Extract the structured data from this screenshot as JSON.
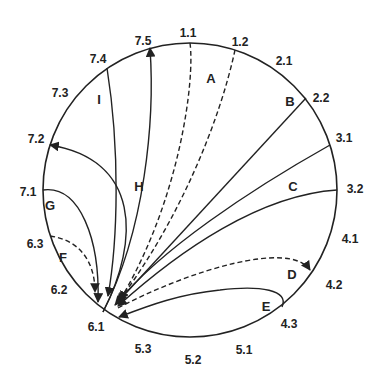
{
  "diagram": {
    "colors": {
      "stroke": "#222222",
      "background": "#ffffff",
      "text": "#222222"
    },
    "circle": {
      "cx": 190,
      "cy": 190,
      "r": 147
    },
    "boundary_labels": [
      {
        "id": "1.1",
        "text": "1.1",
        "x": 188,
        "y": 34
      },
      {
        "id": "1.2",
        "text": "1.2",
        "x": 240,
        "y": 43
      },
      {
        "id": "2.1",
        "text": "2.1",
        "x": 284,
        "y": 62
      },
      {
        "id": "2.2",
        "text": "2.2",
        "x": 321,
        "y": 99
      },
      {
        "id": "3.1",
        "text": "3.1",
        "x": 344,
        "y": 139
      },
      {
        "id": "3.2",
        "text": "3.2",
        "x": 355,
        "y": 190
      },
      {
        "id": "4.1",
        "text": "4.1",
        "x": 350,
        "y": 240
      },
      {
        "id": "4.2",
        "text": "4.2",
        "x": 334,
        "y": 286
      },
      {
        "id": "4.3",
        "text": "4.3",
        "x": 289,
        "y": 325
      },
      {
        "id": "5.1",
        "text": "5.1",
        "x": 244,
        "y": 351
      },
      {
        "id": "5.2",
        "text": "5.2",
        "x": 193,
        "y": 361
      },
      {
        "id": "5.3",
        "text": "5.3",
        "x": 143,
        "y": 350
      },
      {
        "id": "6.1",
        "text": "6.1",
        "x": 96,
        "y": 328
      },
      {
        "id": "6.2",
        "text": "6.2",
        "x": 59,
        "y": 291
      },
      {
        "id": "6.3",
        "text": "6.3",
        "x": 35,
        "y": 245
      },
      {
        "id": "7.1",
        "text": "7.1",
        "x": 28,
        "y": 193
      },
      {
        "id": "7.2",
        "text": "7.2",
        "x": 36,
        "y": 140
      },
      {
        "id": "7.3",
        "text": "7.3",
        "x": 60,
        "y": 94
      },
      {
        "id": "7.4",
        "text": "7.4",
        "x": 98,
        "y": 60
      },
      {
        "id": "7.5",
        "text": "7.5",
        "x": 143,
        "y": 42
      }
    ],
    "region_labels": [
      {
        "id": "A",
        "text": "A",
        "x": 211,
        "y": 80
      },
      {
        "id": "B",
        "text": "B",
        "x": 290,
        "y": 103
      },
      {
        "id": "C",
        "text": "C",
        "x": 293,
        "y": 188
      },
      {
        "id": "D",
        "text": "D",
        "x": 292,
        "y": 276
      },
      {
        "id": "E",
        "text": "E",
        "x": 266,
        "y": 308
      },
      {
        "id": "F",
        "text": "F",
        "x": 63,
        "y": 259
      },
      {
        "id": "G",
        "text": "G",
        "x": 50,
        "y": 207
      },
      {
        "id": "H",
        "text": "H",
        "x": 139,
        "y": 188
      },
      {
        "id": "I",
        "text": "I",
        "x": 99,
        "y": 101
      }
    ],
    "curves": [
      {
        "id": "A-left",
        "region": "A",
        "style": "dashed",
        "arrow": "end",
        "d": "M 190 43 C 195 80, 180 200, 120 300"
      },
      {
        "id": "A-right",
        "region": "A",
        "style": "dashed",
        "arrow": "end",
        "d": "M 235 50 C 220 120, 180 220, 118 302"
      },
      {
        "id": "B",
        "region": "B",
        "style": "solid",
        "arrow": "end",
        "d": "M 306 98 L 115 305"
      },
      {
        "id": "C-upper",
        "region": "C",
        "style": "solid",
        "arrow": "end",
        "d": "M 330 145 C 250 190, 160 250, 117 303"
      },
      {
        "id": "C-lower",
        "region": "C",
        "style": "solid",
        "arrow": "end",
        "d": "M 337 190 C 260 195, 180 250, 118 306"
      },
      {
        "id": "D",
        "region": "D",
        "style": "dashed",
        "arrow": "end",
        "d": "M 118 308 C 190 270, 290 240, 310 270"
      },
      {
        "id": "D-incoming",
        "region": "D",
        "style": "dashed",
        "arrow": "start",
        "d": "M 308 268 C 270 250, 190 262, 118 308"
      },
      {
        "id": "E",
        "region": "E",
        "style": "solid",
        "arrow": "end",
        "d": "M 282 307 C 290 290, 260 285, 220 290 C 180 294, 150 305, 119 317"
      },
      {
        "id": "F",
        "region": "F",
        "style": "dashed",
        "arrow": "end",
        "d": "M 50 236 C 80 240, 95 262, 95 292"
      },
      {
        "id": "G",
        "region": "G",
        "style": "solid",
        "arrow": "end",
        "d": "M 43 190 C 80 185, 100 240, 98 302"
      },
      {
        "id": "H-to-7.2",
        "region": "H",
        "style": "solid",
        "arrow": "end",
        "d": "M 103 312 C 140 240, 140 160, 50 145"
      },
      {
        "id": "H-to-7.5",
        "region": "H",
        "style": "solid",
        "arrow": "end",
        "d": "M 103 312 C 145 230, 155 120, 150 48"
      },
      {
        "id": "I",
        "region": "I",
        "style": "solid",
        "arrow": "end",
        "d": "M 107 68 C 120 150, 118 240, 108 296"
      }
    ]
  }
}
